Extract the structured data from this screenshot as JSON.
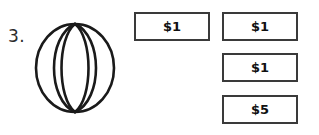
{
  "question": {
    "number_label": "3.",
    "figure": {
      "icon_name": "beach-ball-icon",
      "description": "ball"
    }
  },
  "money_cards": {
    "columns": [
      {
        "column_name": "price-column",
        "cards": [
          {
            "amount": "$1"
          }
        ]
      },
      {
        "column_name": "payment-column",
        "cards": [
          {
            "amount": "$1"
          },
          {
            "amount": "$1"
          },
          {
            "amount": "$5"
          }
        ]
      }
    ]
  },
  "colors": {
    "ink": "#111111",
    "card_border": "#3a3a3a",
    "number_ink": "#2b2b2b",
    "page_background": "#ffffff"
  }
}
